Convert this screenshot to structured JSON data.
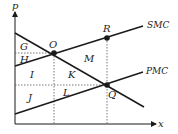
{
  "diagram": {
    "axes": {
      "y_label": "p",
      "x_label": "x"
    },
    "curves": [
      {
        "name": "SMC",
        "label": "SMC"
      },
      {
        "name": "PMC",
        "label": "PMC"
      },
      {
        "name": "Demand",
        "label": ""
      }
    ],
    "points": {
      "O": "O",
      "R": "R",
      "Q": "Q"
    },
    "regions": {
      "G": "G",
      "H": "H",
      "I": "I",
      "J": "J",
      "K": "K",
      "L": "L",
      "M": "M"
    },
    "colors": {
      "line": "#1a1a1a",
      "dotted": "#555555"
    }
  }
}
